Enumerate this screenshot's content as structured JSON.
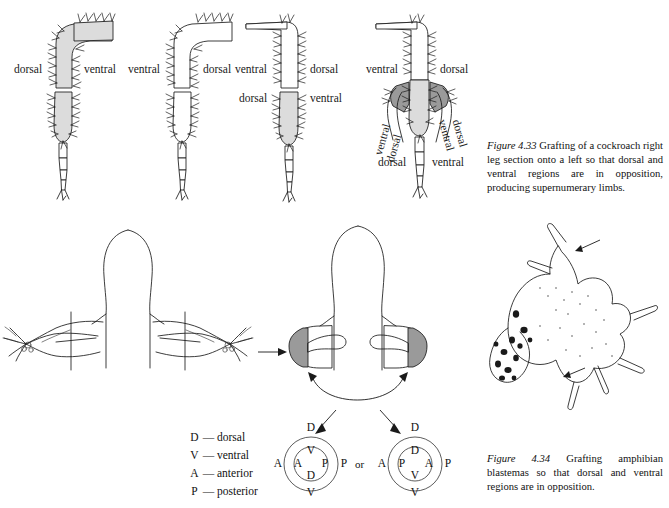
{
  "figure_433": {
    "caption_number": "Figure 4.33",
    "caption_text": "Grafting of a cockroach right leg section onto a left so that dorsal and ventral regions are in opposition, producing supernumerary limbs.",
    "panels": [
      {
        "name": "host-left-leg",
        "labels": [
          {
            "text": "dorsal",
            "side": "left"
          },
          {
            "text": "ventral",
            "side": "right"
          }
        ]
      },
      {
        "name": "donor-right-leg",
        "labels": [
          {
            "text": "ventral",
            "side": "left"
          },
          {
            "text": "dorsal",
            "side": "right"
          }
        ]
      },
      {
        "name": "graft-assembled",
        "labels": [
          {
            "text": "ventral",
            "side": "left-upper"
          },
          {
            "text": "dorsal",
            "side": "right-upper"
          },
          {
            "text": "dorsal",
            "side": "left-lower"
          },
          {
            "text": "ventral",
            "side": "right-lower"
          }
        ]
      },
      {
        "name": "supernumerary-result",
        "labels": [
          {
            "text": "ventral",
            "side": "upper-left"
          },
          {
            "text": "dorsal",
            "side": "upper-right"
          },
          {
            "text": "ventral",
            "side": "rot-outer-left"
          },
          {
            "text": "dorsal",
            "side": "rot-inner-left"
          },
          {
            "text": "ventral",
            "side": "rot-inner-right"
          },
          {
            "text": "dorsal",
            "side": "rot-outer-right"
          },
          {
            "text": "dorsal",
            "side": "bottom-left"
          },
          {
            "text": "ventral",
            "side": "bottom-right"
          }
        ]
      }
    ]
  },
  "figure_434": {
    "caption_number": "Figure 4.34",
    "caption_text": "Grafting amphibian blastemas so that dorsal and ventral regions are in opposition.",
    "key": [
      {
        "letter": "D",
        "dash": "—",
        "term": "dorsal"
      },
      {
        "letter": "V",
        "dash": "—",
        "term": "ventral"
      },
      {
        "letter": "A",
        "dash": "—",
        "term": "anterior"
      },
      {
        "letter": "P",
        "dash": "—",
        "term": "posterior"
      }
    ],
    "connector": "or",
    "diagrams": [
      {
        "name": "axis-circle-left",
        "outer": {
          "top": "D",
          "bottom": "V",
          "left": "A",
          "right": "P"
        },
        "inner": {
          "top": "V",
          "bottom": "D",
          "left": "A",
          "right": "P"
        }
      },
      {
        "name": "axis-circle-right",
        "outer": {
          "top": "D",
          "bottom": "V",
          "left": "A",
          "right": "P"
        },
        "inner": {
          "top": "D",
          "bottom": "V",
          "left": "P",
          "right": "A"
        }
      }
    ]
  },
  "colors": {
    "ink": "#1a1a1a",
    "shade_light": "#dcdcdc",
    "shade_dark": "#9a9a9a",
    "paper": "#ffffff"
  }
}
